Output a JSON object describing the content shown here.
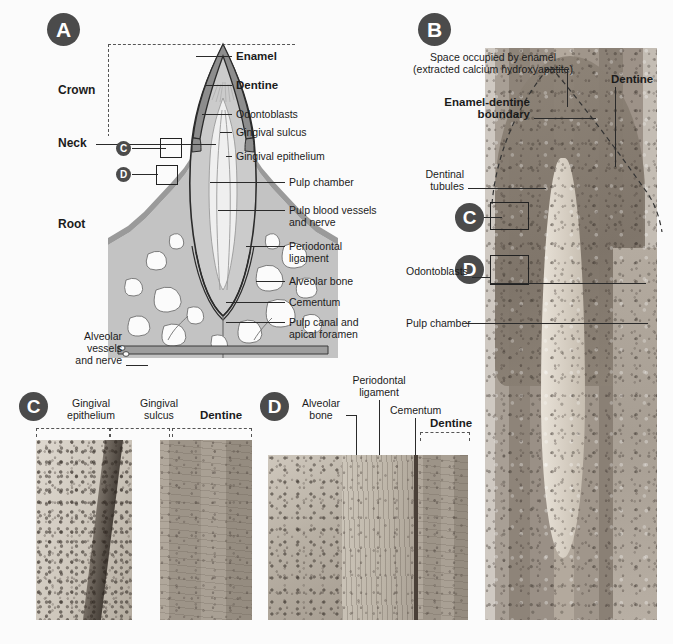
{
  "figure": {
    "background_color": "#fbfbfb",
    "badge_color": "#4b4b4b",
    "label_color": "#1b1b1b"
  },
  "panels": {
    "a": {
      "letter": "A",
      "region_labels": [
        {
          "text": "Crown"
        },
        {
          "text": "Neck"
        },
        {
          "text": "Root"
        }
      ],
      "callouts": [
        {
          "text": "Enamel",
          "bold": true
        },
        {
          "text": "Dentine",
          "bold": true
        },
        {
          "text": "Odontoblasts",
          "bold": false
        },
        {
          "text": "Gingival sulcus",
          "bold": false
        },
        {
          "text": "Gingival epithelium",
          "bold": false
        },
        {
          "text": "Pulp chamber",
          "bold": false
        },
        {
          "text": "Pulp blood vessels\nand nerve",
          "bold": false
        },
        {
          "text": "Periodontal\nligament",
          "bold": false
        },
        {
          "text": "Alveolar bone",
          "bold": false
        },
        {
          "text": "Cementum",
          "bold": false
        },
        {
          "text": "Pulp canal and\napical foramen",
          "bold": false
        },
        {
          "text": "Alveolar\nvessels\nand nerve",
          "bold": false
        }
      ],
      "roi_markers": [
        {
          "letter": "C"
        },
        {
          "letter": "D"
        }
      ],
      "colors": {
        "enamel": "#8d8d8d",
        "dentine": "#c9c9c9",
        "pulp": "#efefef",
        "bone": "#c0c0c0",
        "outline": "#2b2b2b"
      }
    },
    "b": {
      "letter": "B",
      "callouts": [
        {
          "text": "Space occupied by enamel\n(extracted calcium hydroxyapatite)",
          "bold": false
        },
        {
          "text": "Dentine",
          "bold": true
        },
        {
          "text": "Enamel-dentine\nboundary",
          "bold": true
        },
        {
          "text": "Dentinal\ntubules",
          "bold": false
        },
        {
          "text": "Odontoblasts",
          "bold": false
        },
        {
          "text": "Pulp chamber",
          "bold": false
        }
      ],
      "roi_markers": [
        {
          "letter": "C"
        },
        {
          "letter": "D"
        }
      ]
    },
    "c": {
      "letter": "C",
      "callouts": [
        {
          "text": "Gingival\nepithelium",
          "bold": false
        },
        {
          "text": "Gingival\nsulcus",
          "bold": false
        },
        {
          "text": "Dentine",
          "bold": true
        }
      ]
    },
    "d": {
      "letter": "D",
      "callouts": [
        {
          "text": "Alveolar\nbone",
          "bold": false
        },
        {
          "text": "Periodontal\nligament",
          "bold": false
        },
        {
          "text": "Cementum",
          "bold": false
        },
        {
          "text": "Dentine",
          "bold": true
        }
      ]
    }
  }
}
